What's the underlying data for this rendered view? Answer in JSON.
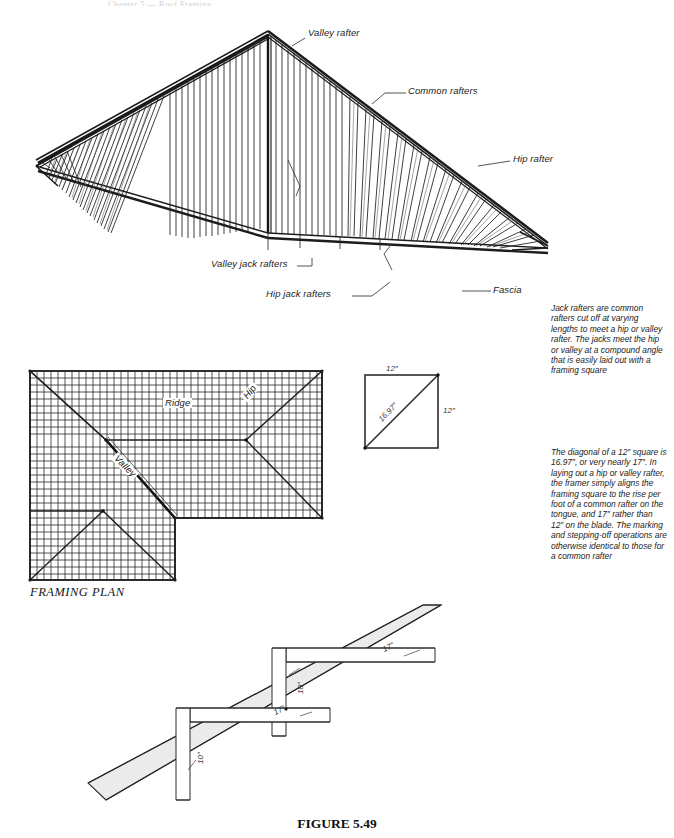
{
  "figure": {
    "caption_prefix": "F",
    "caption_small_caps": "IGURE",
    "caption_number": "5.49",
    "caption_full": "FIGURE 5.49",
    "header_ghost": "Chapter 5 — Roof Framing"
  },
  "isometric": {
    "labels": [
      {
        "id": "valley-rafter",
        "text": "Valley rafter",
        "x": 308,
        "y": 33
      },
      {
        "id": "common-rafters",
        "text": "Common rafters",
        "x": 408,
        "y": 90
      },
      {
        "id": "hip-rafter",
        "text": "Hip rafter",
        "x": 512,
        "y": 158
      },
      {
        "id": "valley-jack",
        "text": "Valley jack rafters",
        "x": 213,
        "y": 262
      },
      {
        "id": "hip-jack",
        "text": "Hip jack rafters",
        "x": 268,
        "y": 292
      },
      {
        "id": "fascia",
        "text": "Fascia",
        "x": 493,
        "y": 288
      }
    ]
  },
  "framing_plan": {
    "caption": "FRAMING PLAN",
    "labels": [
      {
        "id": "ridge",
        "text": "Ridge",
        "x": 163,
        "y": 403,
        "rotate": 0
      },
      {
        "id": "valley",
        "text": "Valley",
        "x": 128,
        "y": 455,
        "rotate": 45
      },
      {
        "id": "hip",
        "text": "Hip",
        "x": 241,
        "y": 395,
        "rotate": -50
      }
    ]
  },
  "square_diagram": {
    "top_dimension": "12″",
    "right_dimension": "12″",
    "diagonal_dimension": "16.97″"
  },
  "stepping_diagram": {
    "dimensions": [
      {
        "id": "run-upper",
        "text": "17″",
        "x": 382,
        "y": 652,
        "rotate": -27
      },
      {
        "id": "rise-upper",
        "text": "10″",
        "x": 296,
        "y": 690,
        "rotate": -90
      },
      {
        "id": "run-lower",
        "text": "17″",
        "x": 276,
        "y": 712,
        "rotate": -27
      },
      {
        "id": "rise-lower",
        "text": "10″",
        "x": 196,
        "y": 760,
        "rotate": -90
      }
    ]
  },
  "notes": {
    "jack_rafters": "Jack rafters are common rafters cut off at varying lengths to meet a hip or valley rafter. The jacks meet the hip or valley at a compound angle that is easily laid out with a framing square",
    "diagonal": "The diagonal of a 12″ square is 16.97″, or very nearly 17″. In laying out a hip or valley rafter, the framer simply aligns the framing square to the rise per foot of a common rafter on the tongue, and 17″ rather than 12″ on the blade. The marking and stepping-off operations are otherwise identical to those for a common rafter"
  },
  "colors": {
    "ink": "#1a1a1a",
    "rafter_fill": "#ffffff",
    "heavy_member": "#111111",
    "shade": "#e9e9e9",
    "thin_line": "#2b2b2b"
  }
}
